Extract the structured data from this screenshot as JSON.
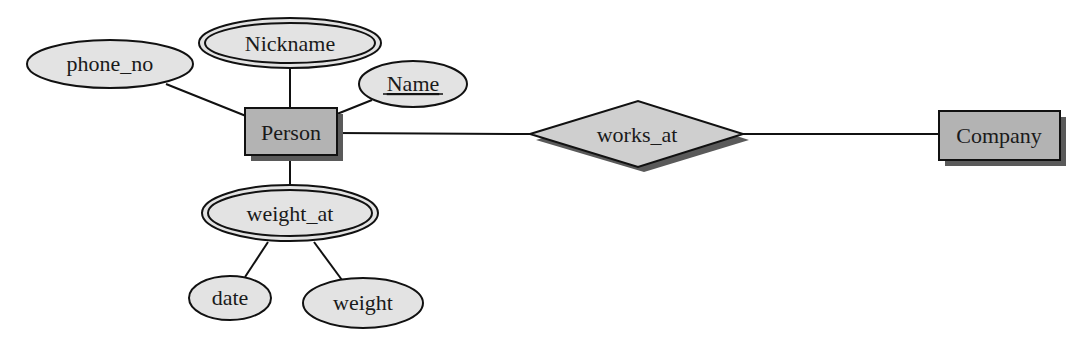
{
  "diagram": {
    "type": "er-diagram",
    "colors": {
      "entity_fill": "#b3b3b3",
      "relationship_fill": "#cfcfcf",
      "attribute_fill": "#e3e3e3",
      "shadow": "#5a5a5a",
      "stroke": "#111111"
    },
    "entities": [
      {
        "id": "person",
        "label": "Person"
      },
      {
        "id": "company",
        "label": "Company"
      }
    ],
    "relationships": [
      {
        "id": "works_at",
        "label": "works_at",
        "connects": [
          "Person",
          "Company"
        ]
      }
    ],
    "attributes": [
      {
        "id": "phone_no",
        "label": "phone_no",
        "of": "Person",
        "kind": "simple"
      },
      {
        "id": "nickname",
        "label": "Nickname",
        "of": "Person",
        "kind": "multivalued"
      },
      {
        "id": "name",
        "label": "Name",
        "of": "Person",
        "kind": "key"
      },
      {
        "id": "weight_at",
        "label": "weight_at",
        "of": "Person",
        "kind": "multivalued-composite"
      },
      {
        "id": "date",
        "label": "date",
        "of": "weight_at",
        "kind": "simple"
      },
      {
        "id": "weight",
        "label": "weight",
        "of": "weight_at",
        "kind": "simple"
      }
    ]
  }
}
